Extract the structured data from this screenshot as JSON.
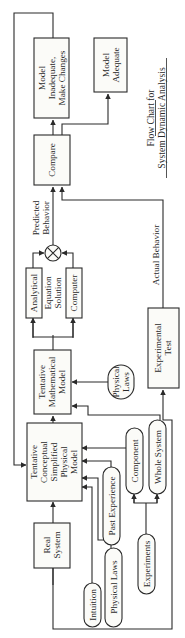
{
  "title": {
    "line1": "Flow Chart for",
    "line2": "System Dynamic Analysis"
  },
  "boxes": {
    "real_system": [
      "Real",
      "System"
    ],
    "conceptual_model": [
      "Tentative",
      "Conceptual",
      "Simplified",
      "Physical",
      "Model"
    ],
    "mathematical_model": [
      "Tentative",
      "Mathematical",
      "Model"
    ],
    "analytical": "Analytical",
    "equation_solution": [
      "Equation",
      "Solution"
    ],
    "computer": "Computer",
    "compare": "Compare",
    "model_inadequate": [
      "Model",
      "Inadequate,",
      "Make Changes"
    ],
    "model_adequate": [
      "Model",
      "Adequate"
    ],
    "experimental_test": [
      "Experimental",
      "Test"
    ]
  },
  "pills": {
    "intuition": "Intuition",
    "physical_laws_1": "Physical Laws",
    "past_experience": "Past Experience",
    "component": "Component",
    "whole_system": "Whole System",
    "experiments": "Experiments",
    "physical_laws_2": [
      "Physical",
      "Laws"
    ]
  },
  "edge_labels": {
    "predicted_behavior": [
      "Predicted",
      "Behavior"
    ],
    "actual_behavior": "Actual Behavior"
  },
  "colors": {
    "ink": "#2a2a2a",
    "paper": "#ffffff"
  }
}
